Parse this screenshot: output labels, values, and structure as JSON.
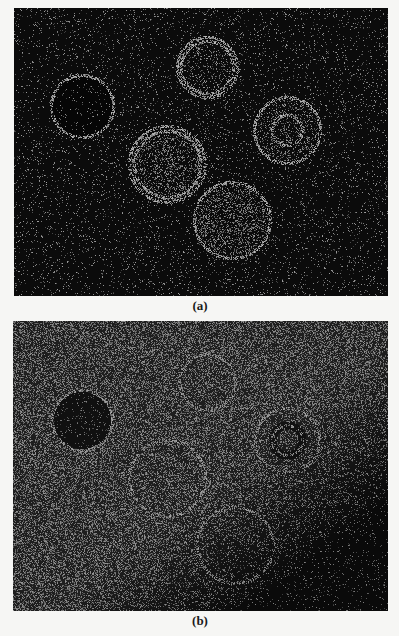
{
  "figure": {
    "background": "#f6f6f4",
    "panels": [
      {
        "id": "a",
        "caption": "(a)",
        "x": 14,
        "y": 8,
        "w": 374,
        "h": 288,
        "caption_x": 170,
        "caption_y": 299,
        "base_color": "#0b0b0b",
        "noise_density": 0.07,
        "noise_brightness": 150,
        "seed": 17,
        "darken_corner": false,
        "objects": [
          {
            "label": "cell-1",
            "cx": 82,
            "cy": 106,
            "r": 31,
            "rings": [
              31
            ],
            "fill": "dark",
            "texture": 0.05
          },
          {
            "label": "cell-2",
            "cx": 207,
            "cy": 67,
            "r": 30,
            "rings": [
              30,
              26
            ],
            "fill": "speckle",
            "texture": 0.18
          },
          {
            "label": "cell-3",
            "cx": 287,
            "cy": 130,
            "r": 33,
            "rings": [
              33,
              15
            ],
            "fill": "speckle",
            "texture": 0.22
          },
          {
            "label": "cell-4",
            "cx": 167,
            "cy": 164,
            "r": 38,
            "rings": [
              38,
              33
            ],
            "fill": "speckle",
            "texture": 0.28
          },
          {
            "label": "cell-5",
            "cx": 232,
            "cy": 220,
            "r": 38,
            "rings": [
              38
            ],
            "fill": "speckle",
            "texture": 0.3
          }
        ]
      },
      {
        "id": "b",
        "caption": "(b)",
        "x": 13,
        "y": 321,
        "w": 375,
        "h": 290,
        "caption_x": 170,
        "caption_y": 614,
        "base_color": "#1e1e1e",
        "noise_density": 0.42,
        "noise_brightness": 120,
        "seed": 91,
        "darken_corner": true,
        "objects": [
          {
            "label": "cell-1",
            "cx": 82,
            "cy": 420,
            "r": 30,
            "rings": [
              30
            ],
            "fill": "dark",
            "texture": 0.08
          },
          {
            "label": "cell-2",
            "cx": 207,
            "cy": 382,
            "r": 28,
            "rings": [
              28
            ],
            "fill": "faint",
            "texture": 0.3
          },
          {
            "label": "cell-3",
            "cx": 287,
            "cy": 440,
            "r": 32,
            "rings": [
              32,
              15
            ],
            "fill": "ring-dark",
            "texture": 0.3
          },
          {
            "label": "cell-4",
            "cx": 167,
            "cy": 478,
            "r": 38,
            "rings": [
              38
            ],
            "fill": "faint",
            "texture": 0.4
          },
          {
            "label": "cell-5",
            "cx": 235,
            "cy": 545,
            "r": 38,
            "rings": [
              38
            ],
            "fill": "faint",
            "texture": 0.35
          }
        ]
      }
    ]
  }
}
